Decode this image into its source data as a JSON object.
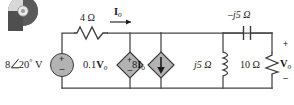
{
  "figure": {
    "type": "ac-circuit-schematic",
    "logo": {
      "name": "disc-logo",
      "description": "partially cropped circular disc icon at top-left"
    },
    "colors": {
      "wire": "#444444",
      "component_fill": "#b0b0b0",
      "component_stroke": "#3a3a3a",
      "text": "#1a1a1a",
      "background": "#ffffff"
    },
    "labels": {
      "source_voltage": "8",
      "source_angle": "20",
      "source_degree": "°",
      "source_unit": "V",
      "resistor_4ohm": "4 Ω",
      "current_io": "I",
      "current_io_sub": "o",
      "dep_voltage_source": "0.1",
      "dep_voltage_source_var": "V",
      "dep_voltage_source_sub": "o",
      "dep_current_source": "8",
      "dep_current_source_var": "I",
      "dep_current_source_sub": "o",
      "inductor_j5": "j5 Ω",
      "capacitor_neg_j5": "–j5 Ω",
      "resistor_10ohm": "10 Ω",
      "output_voltage": "V",
      "output_voltage_sub": "o",
      "plus": "+",
      "minus": "–"
    },
    "components": [
      {
        "name": "independent-voltage-source",
        "label": "8∠20° V",
        "symbol": "circle-with-plus-minus",
        "polarity_top": "+",
        "polarity_bottom": "–"
      },
      {
        "name": "resistor-4-ohm",
        "label": "4 Ω",
        "symbol": "zigzag-horizontal"
      },
      {
        "name": "current-io-arrow",
        "label": "Io",
        "symbol": "arrow-right"
      },
      {
        "name": "dependent-voltage-source",
        "label": "0.1Vo",
        "symbol": "diamond-with-plus-minus",
        "polarity_top": "+",
        "polarity_bottom": "–"
      },
      {
        "name": "dependent-current-source",
        "label": "8Io",
        "symbol": "diamond-with-down-arrow",
        "direction": "down"
      },
      {
        "name": "inductor-j5-ohm",
        "label": "j5 Ω",
        "symbol": "coil-vertical"
      },
      {
        "name": "capacitor-neg-j5-ohm",
        "label": "–j5 Ω",
        "symbol": "parallel-plates-horizontal"
      },
      {
        "name": "resistor-10-ohm",
        "label": "10 Ω",
        "symbol": "zigzag-vertical"
      },
      {
        "name": "output-voltage-label",
        "label": "Vo",
        "polarity_top": "+",
        "polarity_bottom": "–"
      }
    ]
  }
}
